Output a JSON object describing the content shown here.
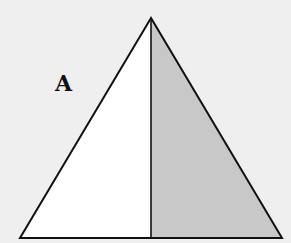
{
  "diagram": {
    "type": "triangle-split",
    "label": "A",
    "colors": {
      "background": "#efefef",
      "left_fill": "#ffffff",
      "right_fill": "#c8c8c8",
      "stroke": "#111111"
    },
    "vertices": {
      "apex": [
        151,
        18
      ],
      "bottom_left": [
        20,
        238
      ],
      "bottom_right": [
        282,
        238
      ],
      "base_mid": [
        151,
        238
      ]
    }
  }
}
